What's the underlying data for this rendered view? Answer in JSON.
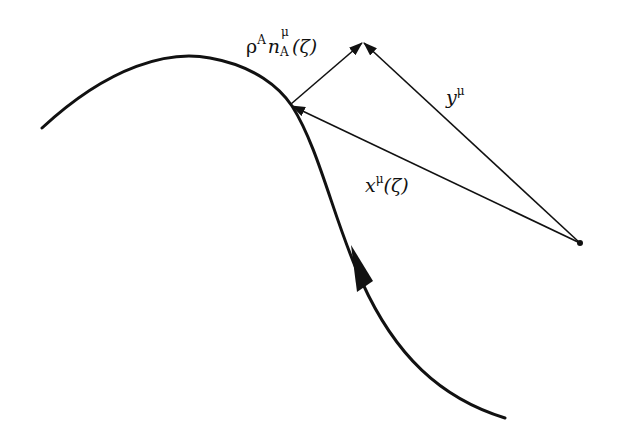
{
  "figure": {
    "colors": {
      "stroke": "#111111",
      "background": "#ffffff"
    },
    "labels": {
      "offset_vector": {
        "base1": "ρ",
        "sup1": "A",
        "base2": "n",
        "sup2": "μ",
        "sub2": "A",
        "arg": "(ζ)"
      },
      "y_vector": {
        "base": "y",
        "sup": "μ"
      },
      "x_vector": {
        "base": "x",
        "sup": "μ",
        "arg": "(ζ)"
      }
    },
    "points": {
      "curve_point": [
        290,
        105
      ],
      "apex": [
        363,
        42
      ],
      "origin": [
        580,
        243
      ]
    },
    "curve": {
      "path": "M42,128 C110,65 170,50 210,58 C255,66 280,88 292,106 C320,150 335,225 362,282 C395,355 440,398 505,418",
      "flow_arrow_at": [
        358,
        270
      ]
    }
  }
}
